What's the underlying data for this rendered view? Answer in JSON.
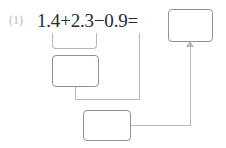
{
  "problem": {
    "number_label": "(1)",
    "expression": "1.4+2.3−0.9=",
    "operands": [
      "1.4",
      "2.3",
      "0.9"
    ],
    "operators": [
      "+",
      "−"
    ],
    "equals_sign": "="
  },
  "answer_boxes": [
    {
      "id": "final-answer",
      "value": "",
      "placeholder": ""
    },
    {
      "id": "first-step-sum",
      "value": "",
      "placeholder": ""
    },
    {
      "id": "second-step-difference",
      "value": "",
      "placeholder": ""
    }
  ],
  "connectors": {
    "bracket_label": "grouping-bracket-over-1.4-plus-2.3",
    "drop_label": "drop-line-from-0.9",
    "elbow_label": "elbow-from-first-step-box",
    "route_label": "route-from-second-step-box-to-final-answer",
    "arrow_label": "arrow-into-final-answer"
  },
  "colors": {
    "box_border": "#8e9294",
    "line": "#b6b8b9",
    "text": "#2b2b2b",
    "number_label": "#b9b9b9",
    "background": "#ffffff"
  }
}
